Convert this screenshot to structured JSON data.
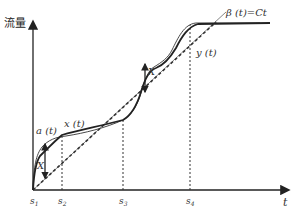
{
  "diagram": {
    "y_axis_label": "流量",
    "x_axis_label": "t",
    "curve_labels": {
      "a": "a (t)",
      "x": "x (t)",
      "y": "y (t)",
      "beta": "β (t)=Ct"
    },
    "gap_label_1": "X",
    "gap_label_2": "X",
    "ticks": [
      "s1",
      "s2",
      "s3",
      "s4"
    ],
    "tick_labels": {
      "s1": "s",
      "s1_sub": "1",
      "s2": "s",
      "s2_sub": "2",
      "s3": "s",
      "s3_sub": "3",
      "s4": "s",
      "s4_sub": "4"
    },
    "colors": {
      "axis": "#222222",
      "curve": "#222222",
      "thin_line": "#666666",
      "dashed": "#333333"
    }
  }
}
